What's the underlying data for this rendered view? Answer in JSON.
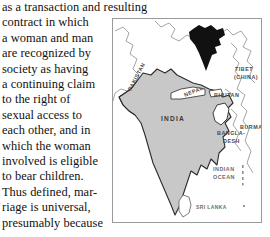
{
  "page": {
    "width": 270,
    "height": 237,
    "background_color": "#ffffff"
  },
  "body_text": {
    "full_paragraph": "as a transaction and resulting contract in which a woman and man are recognized by society as having a continuing claim to the right of sexual access to each other, and in which the woman involved is eligible to bear children. Thus defined, marriage is universal, presumably because",
    "lines": [
      "as a transaction and resulting",
      "contract in which",
      "a woman and man",
      "are recognized by",
      "society as having",
      "a continuing claim",
      "to the right of",
      "sexual access to",
      "each other, and in",
      "which the woman",
      "involved is eligible",
      "to bear children.",
      "Thus defined, mar-",
      "riage is universal,",
      "presumably because"
    ]
  },
  "map": {
    "title": "South Asia locator map of India",
    "frame_color": "#9a9a9a",
    "india_fill": "#c8c8c8",
    "india_outline": "#2b2b2b",
    "neighbor_outline": "#8d8d8d",
    "inset_fill": "#111111",
    "labels": [
      {
        "name": "pakistan",
        "text": "PAKISTAN",
        "x": 18,
        "y": 72,
        "rotation": -62,
        "style": "country"
      },
      {
        "name": "nepal",
        "text": "NEPAL",
        "x": 72,
        "y": 78,
        "rotation": -22,
        "style": "country"
      },
      {
        "name": "tibet",
        "text": "TIBET",
        "x": 122,
        "y": 52,
        "rotation": 0,
        "style": "country"
      },
      {
        "name": "tibet-china",
        "text": "(CHINA)",
        "x": 121,
        "y": 60,
        "rotation": 0,
        "style": "country"
      },
      {
        "name": "bhutan",
        "text": "BHUTAN",
        "x": 101,
        "y": 78,
        "rotation": 0,
        "style": "country"
      },
      {
        "name": "burma",
        "text": "BURMA",
        "x": 127,
        "y": 110,
        "rotation": 0,
        "style": "country"
      },
      {
        "name": "bangla",
        "text": "BANGLA-",
        "x": 106,
        "y": 116,
        "rotation": 0,
        "style": "country"
      },
      {
        "name": "desh",
        "text": "DESH",
        "x": 111,
        "y": 124,
        "rotation": 0,
        "style": "country"
      },
      {
        "name": "india",
        "text": "INDIA",
        "x": 48,
        "y": 102,
        "rotation": 0,
        "style": "india"
      },
      {
        "name": "indian",
        "text": "INDIAN",
        "x": 100,
        "y": 152,
        "rotation": 0,
        "style": "ocean"
      },
      {
        "name": "ocean",
        "text": "OCEAN",
        "x": 100,
        "y": 160,
        "rotation": 0,
        "style": "ocean"
      },
      {
        "name": "sri-lanka",
        "text": "SRI LANKA",
        "x": 83,
        "y": 190,
        "rotation": 0,
        "style": "small"
      }
    ]
  }
}
